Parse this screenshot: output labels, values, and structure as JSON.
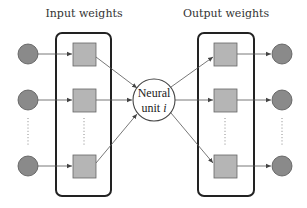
{
  "diagram": {
    "input_title": "Input weights",
    "output_title": "Output weights",
    "unit_label_line1": "Neural",
    "unit_label_line2": "unit ",
    "unit_label_index": "i",
    "colors": {
      "node_fill": "#8a8a8a",
      "node_stroke": "#555555",
      "weight_fill": "#b5b5b5",
      "weight_stroke": "#666666",
      "box_stroke": "#222222",
      "edge": "#555555"
    },
    "input_nodes": [
      "input-1",
      "input-2",
      "input-n"
    ],
    "output_nodes": [
      "output-1",
      "output-2",
      "output-n"
    ],
    "ellipsis": "⋮"
  }
}
